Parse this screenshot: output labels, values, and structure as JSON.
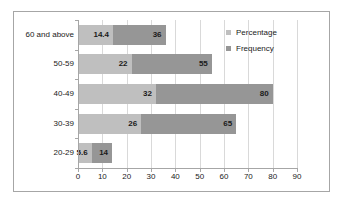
{
  "chart_data": {
    "type": "bar",
    "orientation": "horizontal",
    "stacked": true,
    "title": "",
    "xlabel": "",
    "ylabel": "",
    "xlim": [
      0,
      90
    ],
    "xticks": [
      0,
      10,
      20,
      30,
      40,
      50,
      60,
      70,
      80,
      90
    ],
    "grid": true,
    "legend_position": "inside-top-right",
    "categories": [
      "20-29",
      "30-39",
      "40-49",
      "50-59",
      "60 and above"
    ],
    "series": [
      {
        "name": "Percentage",
        "color": "#bfbfbf",
        "values": [
          5.6,
          26,
          32,
          22,
          14.4
        ]
      },
      {
        "name": "Frequency",
        "color": "#969696",
        "values": [
          14,
          65,
          80,
          55,
          36
        ],
        "note": "labels show cumulative end value of each stacked bar"
      }
    ],
    "rows": [
      {
        "category": "20-29",
        "percentage": 5.6,
        "percentage_label": "5.6",
        "frequency_end": 14,
        "frequency_label": "14"
      },
      {
        "category": "30-39",
        "percentage": 26,
        "percentage_label": "26",
        "frequency_end": 65,
        "frequency_label": "65"
      },
      {
        "category": "40-49",
        "percentage": 32,
        "percentage_label": "32",
        "frequency_end": 80,
        "frequency_label": "80"
      },
      {
        "category": "50-59",
        "percentage": 22,
        "percentage_label": "22",
        "frequency_end": 55,
        "frequency_label": "55"
      },
      {
        "category": "60 and above",
        "percentage": 14.4,
        "percentage_label": "14.4",
        "frequency_end": 36,
        "frequency_label": "36"
      }
    ]
  },
  "legend": {
    "items": [
      {
        "label": "Percentage",
        "color": "#bfbfbf"
      },
      {
        "label": "Frequency",
        "color": "#969696"
      }
    ]
  },
  "colors": {
    "percentage": "#bfbfbf",
    "frequency": "#969696",
    "axis": "#a6a6a6",
    "gridline": "#d9d9d9",
    "text": "#1a1a1a",
    "background": "#ffffff"
  }
}
